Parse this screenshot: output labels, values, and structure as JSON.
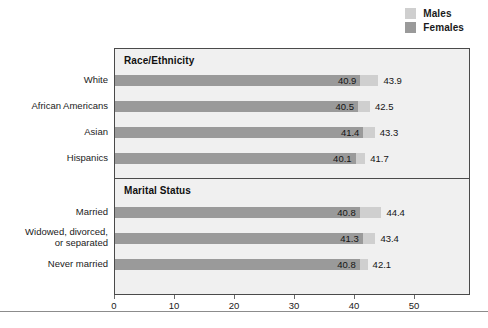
{
  "legend": {
    "position": "top-right",
    "items": [
      {
        "label": "Males",
        "color": "#cfcfcf",
        "icon": "legend-swatch-males"
      },
      {
        "label": "Females",
        "color": "#9a9a9a",
        "icon": "legend-swatch-females"
      }
    ]
  },
  "colors": {
    "males": "#cfcfcf",
    "females": "#9a9a9a",
    "plot_background": "#f0f0f0",
    "frame": "#4a4a4a",
    "text": "#1a1a1a"
  },
  "sections": [
    {
      "title": "Race/Ethnicity"
    },
    {
      "title": "Marital Status"
    }
  ],
  "axis": {
    "ticks": [
      "0",
      "10",
      "20",
      "30",
      "40",
      "50"
    ]
  },
  "chart_data": {
    "type": "bar",
    "orientation": "horizontal",
    "title": "",
    "subtitle": "",
    "xlabel": "",
    "ylabel": "",
    "xlim": [
      0,
      50
    ],
    "xticks": [
      0,
      10,
      20,
      30,
      40,
      50
    ],
    "grid": false,
    "legend_position": "top-right",
    "groups": [
      {
        "name": "Race/Ethnicity",
        "categories": [
          "White",
          "African Americans",
          "Asian",
          "Hispanics"
        ],
        "series": [
          {
            "name": "Females",
            "values": [
              40.9,
              40.5,
              41.4,
              40.1
            ]
          },
          {
            "name": "Males",
            "values": [
              43.9,
              42.5,
              43.3,
              41.7
            ]
          }
        ]
      },
      {
        "name": "Marital Status",
        "categories": [
          "Married",
          "Widowed, divorced, or separated",
          "Never married"
        ],
        "series": [
          {
            "name": "Females",
            "values": [
              40.8,
              41.3,
              40.8
            ]
          },
          {
            "name": "Males",
            "values": [
              44.4,
              43.4,
              42.1
            ]
          }
        ]
      }
    ],
    "series": [
      {
        "name": "Females",
        "color": "#9a9a9a",
        "values": [
          40.9,
          40.5,
          41.4,
          40.1,
          40.8,
          41.3,
          40.8
        ]
      },
      {
        "name": "Males",
        "color": "#cfcfcf",
        "values": [
          43.9,
          42.5,
          43.3,
          41.7,
          44.4,
          43.4,
          42.1
        ]
      }
    ],
    "categories": [
      "White",
      "African Americans",
      "Asian",
      "Hispanics",
      "Married",
      "Widowed, divorced, or separated",
      "Never married"
    ]
  },
  "rows": [
    {
      "label_line1": "White",
      "label_line2": "",
      "females": "40.9",
      "males": "43.9",
      "females_value": 40.9,
      "males_value": 43.9,
      "top": 26,
      "label_top": 26
    },
    {
      "label_line1": "African Americans",
      "label_line2": "",
      "females": "40.5",
      "males": "42.5",
      "females_value": 40.5,
      "males_value": 42.5,
      "top": 52,
      "label_top": 52
    },
    {
      "label_line1": "Asian",
      "label_line2": "",
      "females": "41.4",
      "males": "43.3",
      "females_value": 41.4,
      "males_value": 43.3,
      "top": 78,
      "label_top": 78
    },
    {
      "label_line1": "Hispanics",
      "label_line2": "",
      "females": "40.1",
      "males": "41.7",
      "females_value": 40.1,
      "males_value": 41.7,
      "top": 104,
      "label_top": 104
    },
    {
      "label_line1": "Married",
      "label_line2": "",
      "females": "40.8",
      "males": "44.4",
      "females_value": 40.8,
      "males_value": 44.4,
      "top": 158,
      "label_top": 158
    },
    {
      "label_line1": "Widowed, divorced,",
      "label_line2": "or separated",
      "females": "41.3",
      "males": "43.4",
      "females_value": 41.3,
      "males_value": 43.4,
      "top": 184,
      "label_top": 178
    },
    {
      "label_line1": "Never married",
      "label_line2": "",
      "females": "40.8",
      "males": "42.1",
      "females_value": 40.8,
      "males_value": 42.1,
      "top": 210,
      "label_top": 210
    }
  ],
  "layout": {
    "divider_top": 129,
    "section1_title_top": 6,
    "section2_title_top": 136
  }
}
